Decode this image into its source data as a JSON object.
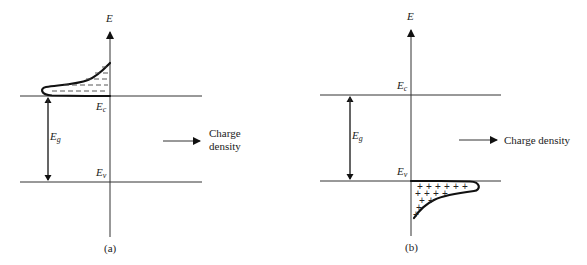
{
  "panels": [
    {
      "id": "a",
      "caption": "(a)",
      "axis_label": "E",
      "conduction_band_label": "E",
      "conduction_band_sub": "c",
      "valence_band_label": "E",
      "valence_band_sub": "v",
      "gap_label": "E",
      "gap_sub": "g",
      "arrow_label_line1": "Charge",
      "arrow_label_line2": "density",
      "distribution": "electrons above E_c (negative charge, shown as dashes)"
    },
    {
      "id": "b",
      "caption": "(b)",
      "axis_label": "E",
      "conduction_band_label": "E",
      "conduction_band_sub": "c",
      "valence_band_label": "E",
      "valence_band_sub": "v",
      "gap_label": "E",
      "gap_sub": "g",
      "arrow_label": "Charge density",
      "distribution": "holes below E_v (positive charge, shown as plus signs)"
    }
  ],
  "symbols": {
    "minus": "–",
    "plus": "+"
  }
}
